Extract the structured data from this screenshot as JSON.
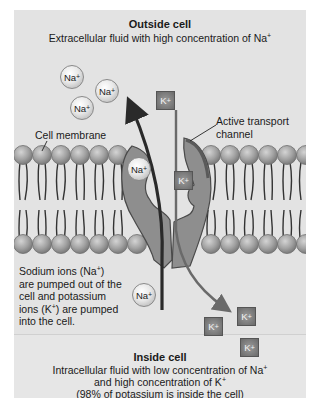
{
  "outside": {
    "title": "Outside cell",
    "subtitle_text": "Extracellular fluid with high concentration of Na",
    "subtitle_sup": "+"
  },
  "inside": {
    "title": "Inside cell",
    "line1_text": "Intracellular fluid with low concentration of Na",
    "line1_sup": "+",
    "line2_text": "and high concentration of K",
    "line2_sup": "+",
    "line3": "(98% of potassium is inside the cell)"
  },
  "labels": {
    "cell_membrane": "Cell membrane",
    "channel_line1": "Active transport",
    "channel_line2": "channel",
    "description": [
      {
        "text": "Sodium ions (Na",
        "sup": "+",
        "tail": ")"
      },
      {
        "text": "are pumped out of the",
        "sup": "",
        "tail": ""
      },
      {
        "text": "cell and potassium",
        "sup": "",
        "tail": ""
      },
      {
        "text": "ions (K",
        "sup": "+",
        "tail": ") are pumped"
      },
      {
        "text": "into the cell.",
        "sup": "",
        "tail": ""
      }
    ]
  },
  "ions": {
    "sodium_symbol": "Na",
    "potassium_symbol": "K",
    "charge": "+"
  },
  "colors": {
    "panel_bg": "#e3e3e3",
    "phospholipid_head": "#9c9c9c",
    "protein_channel": "#8c8c8c",
    "arrow_dark": "#2a2a2a",
    "arrow_light": "#6a6a6a"
  }
}
